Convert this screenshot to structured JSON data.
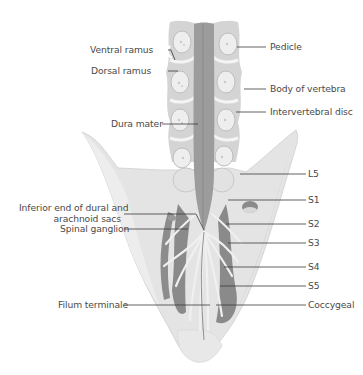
{
  "figure": {
    "colors": {
      "background": "#ffffff",
      "bone_light": "#e6e6e6",
      "bone_mid": "#d2d2d2",
      "dura": "#9a9a9a",
      "dura_dark": "#7e7e7e",
      "nerve_light": "#f2f2f2",
      "leader_line": "#3a3a3a",
      "label_text": "#4a4a4a"
    }
  },
  "labels_left": [
    {
      "id": "ventral-ramus",
      "text": "Ventral ramus"
    },
    {
      "id": "dorsal-ramus",
      "text": "Dorsal ramus"
    },
    {
      "id": "dura-mater",
      "text": "Dura mater"
    },
    {
      "id": "inferior-end",
      "text": "Inferior end of dural and",
      "text2": "arachnoid sacs"
    },
    {
      "id": "spinal-ganglion",
      "text": "Spinal ganglion"
    },
    {
      "id": "filum-terminale",
      "text": "Filum terminale"
    }
  ],
  "labels_right": [
    {
      "id": "pedicle",
      "text": "Pedicle"
    },
    {
      "id": "body-of-vertebra",
      "text": "Body of vertebra"
    },
    {
      "id": "intervertebral-disc",
      "text": "Intervertebral disc"
    },
    {
      "id": "l5",
      "text": "L5"
    },
    {
      "id": "s1",
      "text": "S1"
    },
    {
      "id": "s2",
      "text": "S2"
    },
    {
      "id": "s3",
      "text": "S3"
    },
    {
      "id": "s4",
      "text": "S4"
    },
    {
      "id": "s5",
      "text": "S5"
    },
    {
      "id": "coccygeal",
      "text": "Coccygeal"
    }
  ]
}
